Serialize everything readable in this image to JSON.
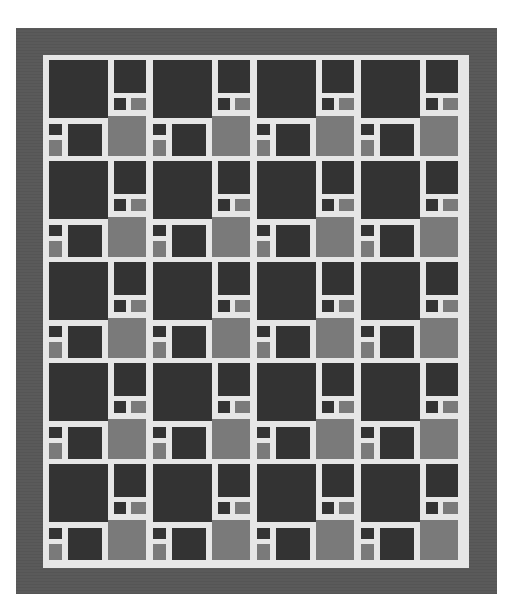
{
  "quilt": {
    "title": "",
    "rows": 5,
    "columns": 4,
    "block_width_px": 104,
    "block_height_px": 101,
    "colors": {
      "background": "#ffffff",
      "border": "#5a5a5a",
      "sashing": "#e6e6e6",
      "dark": "#333333",
      "medium": "#7a7a7a"
    },
    "block_pieces": [
      {
        "name": "large-dark-square",
        "x": 6,
        "y": 5,
        "w": 59,
        "h": 58,
        "tone": "dark"
      },
      {
        "name": "top-right-dark",
        "x": 71,
        "y": 5,
        "w": 32,
        "h": 33,
        "tone": "dark"
      },
      {
        "name": "center-small-dark",
        "x": 71,
        "y": 43,
        "w": 12,
        "h": 12,
        "tone": "dark"
      },
      {
        "name": "center-small-medium",
        "x": 88,
        "y": 43,
        "w": 15,
        "h": 12,
        "tone": "medium"
      },
      {
        "name": "bottom-right-medium-square",
        "x": 65,
        "y": 61,
        "w": 38,
        "h": 40,
        "tone": "medium"
      },
      {
        "name": "bottom-left-small-dark",
        "x": 6,
        "y": 69,
        "w": 13,
        "h": 11,
        "tone": "dark"
      },
      {
        "name": "bottom-left-small-medium",
        "x": 6,
        "y": 85,
        "w": 13,
        "h": 16,
        "tone": "medium"
      },
      {
        "name": "bottom-center-dark-rect",
        "x": 25,
        "y": 69,
        "w": 34,
        "h": 32,
        "tone": "dark"
      }
    ]
  }
}
